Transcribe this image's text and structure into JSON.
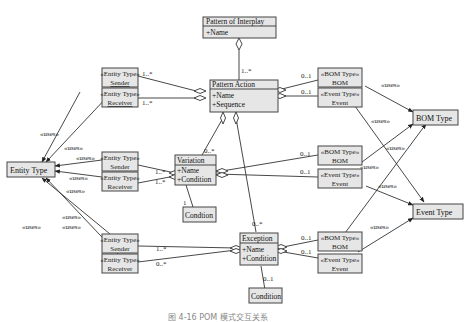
{
  "diagram": {
    "caption": "图 4-16 POM 模式交互关系",
    "classes": {
      "pattern_of_interplay": {
        "name": "Pattern of Interplay",
        "attrs": "+Name"
      },
      "pattern_action": {
        "name": "Pattern Action",
        "attr1": "+Name",
        "attr2": "+Sequence"
      },
      "variation": {
        "name": "Variation",
        "attr1": "+Name",
        "attr2": "+Condition"
      },
      "exception": {
        "name": "Exception",
        "attr1": "+Name",
        "attr2": "+Condition"
      },
      "entity_type": {
        "name": "Entity Type"
      },
      "bom_type": {
        "name": "BOM Type"
      },
      "event_type": {
        "name": "Event Type"
      },
      "condition_variation": {
        "name": "Condtion"
      },
      "condition_exception": {
        "name": "Condition"
      }
    },
    "roles": {
      "pa_sender": {
        "stereotype": "«Entity Type»",
        "name": "Sender"
      },
      "pa_receiver": {
        "stereotype": "«Entity Type»",
        "name": "Receiver"
      },
      "pa_bom": {
        "stereotype": "«BOM Type»",
        "name": "BOM"
      },
      "pa_event": {
        "stereotype": "«Event Type»",
        "name": "Event"
      },
      "var_sender": {
        "stereotype": "«Entity Type»",
        "name": "Sender"
      },
      "var_receiver": {
        "stereotype": "«Entity Type»",
        "name": "Receiver"
      },
      "var_bom": {
        "stereotype": "«BOM Type»",
        "name": "BOM"
      },
      "var_event": {
        "stereotype": "«Event Type»",
        "name": "Event"
      },
      "exc_sender": {
        "stereotype": "«Entity Type»",
        "name": "Sender"
      },
      "exc_receiver": {
        "stereotype": "«Entity Type»",
        "name": "Receiver"
      },
      "exc_bom": {
        "stereotype": "«BOM Type»",
        "name": "BOM"
      },
      "exc_event": {
        "stereotype": "«Event Type»",
        "name": "Event"
      }
    },
    "multiplicities": {
      "poi_pa": "1..*",
      "pa_sender": "1..*",
      "pa_receiver": "1..*",
      "pa_bom": "0..1",
      "pa_event": "0..1",
      "pa_variation": "0..*",
      "pa_exception": "0..*",
      "var_sender": "1..*",
      "var_receiver": "1..*",
      "var_bom": "0..1",
      "var_event": "0..1",
      "var_condition": "1",
      "exc_sender": "1..*",
      "exc_receiver": "0..*",
      "exc_bom": "0..1",
      "exc_event": "0..1",
      "exc_condition": "0..1"
    },
    "uses_label": "«uses»"
  }
}
